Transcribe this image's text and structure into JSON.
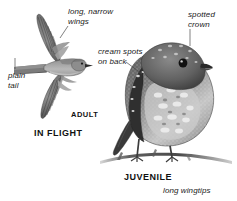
{
  "plate": {
    "title": "Spotted Flycatcher identification plate",
    "background_color": "#ffffff",
    "ink_color": "#1a1a1a",
    "leader_color": "#4a4a4a",
    "width": 237,
    "height": 201
  },
  "annotations": {
    "wings": "long, narrow\nwings",
    "crown": "spotted\ncrown",
    "back_spots": "cream spots\non back",
    "tail": "plain\ntail",
    "wingtips": "long wingtips"
  },
  "stage_labels": {
    "adult": "ADULT",
    "in_flight": "IN FLIGHT",
    "juvenile": "JUVENILE"
  },
  "figures": {
    "flying_bird": {
      "name": "adult in flight",
      "orientation": "facing right, wings fully spread, viewed from above"
    },
    "perched_bird": {
      "name": "juvenile perched",
      "orientation": "facing left-front, perched on a bare twig"
    },
    "perch": {
      "name": "bare twig branch"
    }
  }
}
